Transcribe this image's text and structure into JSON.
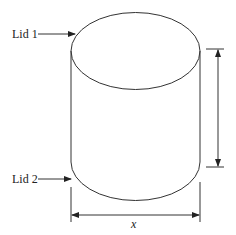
{
  "diagram": {
    "shape": "cylinder",
    "labels": {
      "lid_top": "Lid 1",
      "lid_bottom": "Lid 2",
      "width_dimension": "x",
      "height_dimension": ""
    },
    "colors": {
      "stroke": "#333333",
      "background": "#ffffff"
    }
  }
}
